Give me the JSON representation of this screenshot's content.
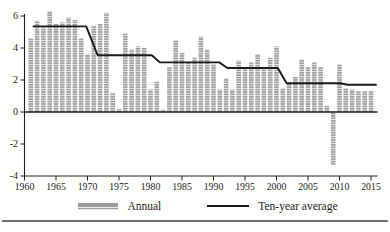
{
  "legend": {
    "annual_label": "Annual",
    "ten_year_label": "Ten-year average"
  },
  "colors": {
    "bar": "#9c9c9c",
    "bar_stripe": "#ebebeb",
    "average_line": "#1a1a1a",
    "axis": "#1c1c1c",
    "text": "#1c1c1c",
    "page_rule": "#6f6f6f",
    "background": "#ffffff"
  },
  "chart_data": {
    "type": "bar",
    "title": "",
    "xlabel": "",
    "ylabel": "",
    "grid": false,
    "legend_position": "bottom",
    "x_axis": {
      "range": [
        1960,
        2016
      ],
      "ticks": [
        1960,
        1965,
        1970,
        1975,
        1980,
        1985,
        1990,
        1995,
        2000,
        2005,
        2010,
        2015
      ]
    },
    "y_axis": {
      "range": [
        -4,
        6
      ],
      "ticks": [
        6,
        4,
        2,
        0,
        -2,
        -4
      ],
      "tick_labels": [
        "6",
        "4",
        "2",
        "0",
        "-2",
        "-4"
      ]
    },
    "series": [
      {
        "name": "Annual",
        "type": "bar",
        "years": [
          1961,
          1962,
          1963,
          1964,
          1965,
          1966,
          1967,
          1968,
          1969,
          1970,
          1971,
          1972,
          1973,
          1974,
          1975,
          1976,
          1977,
          1978,
          1979,
          1980,
          1981,
          1982,
          1983,
          1984,
          1985,
          1986,
          1987,
          1988,
          1989,
          1990,
          1991,
          1992,
          1993,
          1994,
          1995,
          1996,
          1997,
          1998,
          1999,
          2000,
          2001,
          2002,
          2003,
          2004,
          2005,
          2006,
          2007,
          2008,
          2009,
          2010,
          2011,
          2012,
          2013,
          2014,
          2015
        ],
        "values": [
          4.6,
          5.7,
          5.3,
          6.3,
          5.5,
          5.6,
          5.9,
          5.75,
          4.6,
          3.6,
          5.4,
          5.5,
          6.2,
          1.2,
          0.2,
          4.9,
          3.9,
          4.1,
          4.0,
          1.4,
          1.9,
          0.15,
          2.8,
          4.5,
          3.7,
          3.1,
          3.4,
          4.7,
          3.9,
          3.0,
          1.4,
          2.1,
          1.4,
          3.2,
          2.8,
          3.1,
          3.6,
          2.8,
          3.4,
          4.1,
          1.5,
          1.8,
          2.2,
          3.3,
          2.8,
          3.1,
          2.8,
          0.4,
          -3.3,
          3.0,
          1.5,
          1.4,
          1.3,
          1.3,
          1.3
        ]
      },
      {
        "name": "Ten-year average",
        "type": "step_line",
        "decade_averages": {
          "1961-1970": 5.35,
          "1971-1980": 3.55,
          "1981-1990": 3.1,
          "1991-2000": 2.75,
          "2001-2010": 1.8,
          "2011-2015": 1.7
        },
        "points": [
          [
            1961.3,
            5.35
          ],
          [
            1969.8,
            5.35
          ],
          [
            1971.6,
            3.55
          ],
          [
            1980.2,
            3.55
          ],
          [
            1981.5,
            3.1
          ],
          [
            1990.9,
            3.1
          ],
          [
            1992.2,
            2.75
          ],
          [
            2000.2,
            2.75
          ],
          [
            2001.6,
            1.8
          ],
          [
            2010.1,
            1.8
          ],
          [
            2011.3,
            1.7
          ],
          [
            2015.9,
            1.7
          ]
        ]
      }
    ]
  }
}
